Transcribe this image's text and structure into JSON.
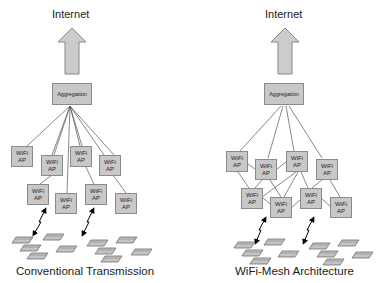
{
  "panels": [
    {
      "id": "conventional",
      "top_label": "Internet",
      "aggregation_label": "Aggregation",
      "caption": "Conventional Transmission",
      "ap_label_line1": "WiFi",
      "ap_label_line2": "AP",
      "ap_count": 8,
      "device_clusters": 2
    },
    {
      "id": "mesh",
      "top_label": "Internet",
      "aggregation_label": "Aggregation",
      "caption": "WiFi-Mesh Architecture",
      "ap_label_line1": "WiFi",
      "ap_label_line2": "AP",
      "ap_count": 8,
      "device_clusters": 2
    }
  ],
  "colors": {
    "box_fill": "#c8c8c8",
    "box_border": "#8a8a8a",
    "arrow_fill": "#cccccc",
    "line": "#555555"
  }
}
